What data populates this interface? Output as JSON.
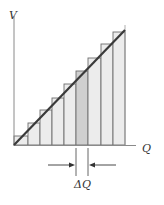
{
  "diagram": {
    "type": "staircase approximation of linear V vs Q graph",
    "axes": {
      "y_label": "V",
      "x_label": "Q"
    },
    "increment_label": "ΔQ",
    "bars_count": 9,
    "highlighted_bar_index": 5,
    "colors": {
      "axis": "#8a8a8a",
      "line": "#3a3a3a",
      "bar_fill": "#ececec",
      "bar_edge": "#6e6e6e",
      "highlight_fill": "#cfcfcf",
      "arrow": "#333333"
    }
  }
}
